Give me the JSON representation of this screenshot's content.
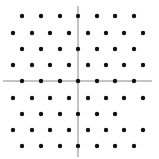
{
  "diagram": {
    "type": "hexagonal-lattice-points",
    "background": "#ffffff",
    "dot_color": "#111111",
    "axis_color": "#8a8a8a",
    "dot_radius": 2.2,
    "axes": {
      "horizontal": {
        "x1": 3,
        "x2": 152,
        "y": 81
      },
      "vertical": {
        "x": 78,
        "y1": 6,
        "y2": 157
      }
    },
    "rows": [
      {
        "y": 16,
        "xs": [
          22,
          41,
          60,
          78,
          97,
          115,
          134
        ]
      },
      {
        "y": 33,
        "xs": [
          13,
          32,
          50,
          69,
          88,
          106,
          124,
          143
        ]
      },
      {
        "y": 49,
        "xs": [
          22,
          41,
          60,
          78,
          97,
          115,
          134
        ]
      },
      {
        "y": 65,
        "xs": [
          13,
          32,
          50,
          69,
          88,
          106,
          124,
          143
        ]
      },
      {
        "y": 81,
        "xs": [
          22,
          41,
          60,
          78,
          97,
          115,
          134
        ]
      },
      {
        "y": 98,
        "xs": [
          13,
          32,
          50,
          69,
          88,
          106,
          124,
          143
        ]
      },
      {
        "y": 114,
        "xs": [
          22,
          41,
          60,
          78,
          97,
          115
        ]
      },
      {
        "y": 130,
        "xs": [
          13,
          32,
          50,
          69,
          88,
          106,
          124,
          143
        ]
      },
      {
        "y": 146,
        "xs": [
          22,
          41,
          60,
          78,
          97,
          115,
          134
        ]
      }
    ],
    "point_count": 66
  }
}
